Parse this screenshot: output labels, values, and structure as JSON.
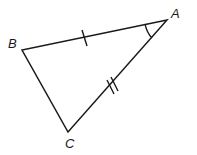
{
  "diagram": {
    "type": "triangle",
    "vertices": [
      {
        "label": "A",
        "x": 167,
        "y": 20
      },
      {
        "label": "B",
        "x": 22,
        "y": 50
      },
      {
        "label": "C",
        "x": 68,
        "y": 132
      }
    ],
    "markings": {
      "AB": "single tick (congruent side)",
      "AC": "double tick (congruent side)",
      "angle_A": "single arc"
    },
    "colors": {
      "stroke": "#1a1a1a",
      "background": "#ffffff"
    }
  }
}
